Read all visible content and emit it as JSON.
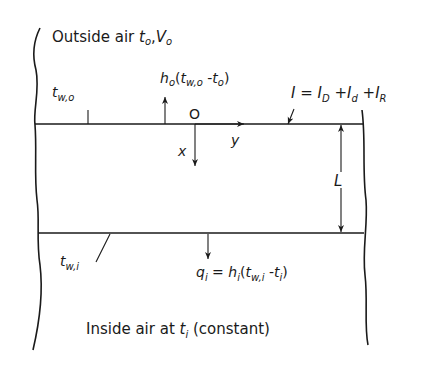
{
  "diagram": {
    "type": "wall heat transfer schematic",
    "outside_label": {
      "text": "Outside air ",
      "t": "t",
      "t_sub": "o",
      "sep": ",",
      "V": "V",
      "V_sub": "o"
    },
    "outer_wall_temp": {
      "t": "t",
      "sub": "w,o"
    },
    "outer_convection": {
      "h": "h",
      "h_sub": "o",
      "open": "(",
      "t1": "t",
      "t1_sub": "w,o",
      "minus": " -",
      "t2": "t",
      "t2_sub": "o",
      "close": ")"
    },
    "origin_label": "O",
    "x_axis_label": "x",
    "y_axis_label": "y",
    "irradiation": {
      "I": "I",
      "eq": " = ",
      "I1": "I",
      "I1_sub": "D",
      "plus1": " +",
      "I2": "I",
      "I2_sub": "d",
      "plus2": " +",
      "I3": "I",
      "I3_sub": "R"
    },
    "thickness_label": "L",
    "inner_wall_temp": {
      "t": "t",
      "sub": "w,i"
    },
    "inner_flux": {
      "q": "q",
      "q_sub": "i",
      "eq": " = ",
      "h": "h",
      "h_sub": "i",
      "open": "(",
      "t1": "t",
      "t1_sub": "w,i",
      "minus": " -",
      "t2": "t",
      "t2_sub": "i",
      "close": ")"
    },
    "inside_label": {
      "text": "Inside air at ",
      "t": "t",
      "t_sub": "i",
      "suffix": " (constant)"
    },
    "colors": {
      "ink": "#1a1a1a",
      "background": "#ffffff"
    }
  }
}
